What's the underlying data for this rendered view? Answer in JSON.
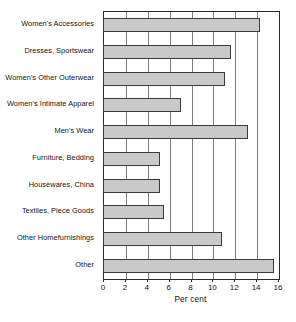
{
  "chart_data": {
    "type": "bar",
    "orientation": "horizontal",
    "title": "",
    "xlabel": "Per cent",
    "ylabel": "",
    "xlim": [
      0,
      16
    ],
    "ylim": null,
    "grid": true,
    "legend": null,
    "xticks": [
      0,
      2,
      4,
      6,
      8,
      10,
      12,
      14,
      16
    ],
    "xtick_labels": [
      "0",
      "2",
      "4",
      "6",
      "8",
      "10",
      "12",
      "14",
      "16"
    ],
    "categories": [
      "Women's Accessories",
      "Dresses, Sportswear",
      "Women's Other Outerwear",
      "Women's Intimate Apparel",
      "Men's Wear",
      "Furniture, Bedding",
      "Housewares, China",
      "Textiles, Piece Goods",
      "Other Homefurnishings",
      "Other"
    ],
    "values": [
      14.3,
      11.6,
      11.1,
      7.0,
      13.2,
      5.1,
      5.1,
      5.5,
      10.8,
      15.5
    ],
    "bar_fill_color": "#c9c9c9",
    "bar_border_color": "#3a3a3a",
    "gridline_color": "#7d7d7d",
    "axis_color": "#2b2b2b"
  }
}
